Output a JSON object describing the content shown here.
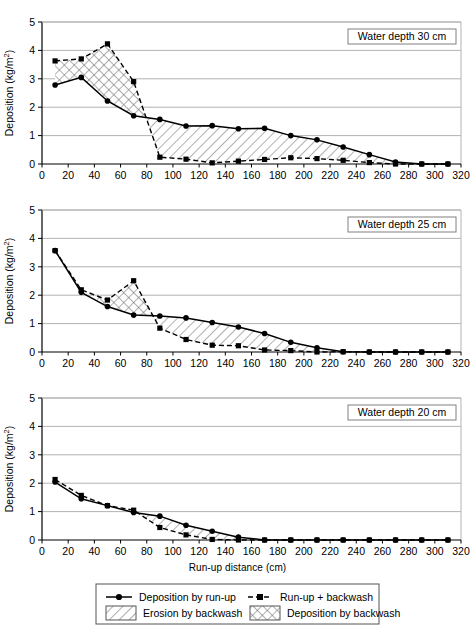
{
  "figure": {
    "xlabel": "Run-up distance (cm)",
    "ylabel": "Deposition (kg/m2)",
    "ylabel_base": "Deposition (kg/m",
    "ylabel_sup": "2",
    "ylabel_close": ")",
    "x_ticks": [
      0,
      20,
      40,
      60,
      80,
      100,
      120,
      140,
      160,
      180,
      200,
      220,
      240,
      260,
      280,
      300,
      320
    ],
    "y_ticks": [
      0,
      1,
      2,
      3,
      4,
      5
    ],
    "xlim": [
      0,
      320
    ],
    "ylim": [
      0,
      5
    ],
    "grid": "horizontal",
    "colors": {
      "axis": "#000000",
      "gridline": "#b3b3b3",
      "series_runup": "#000000",
      "series_backwash": "#000000",
      "hatch": "#6e6e6e",
      "panel_border": "#808080",
      "label_box_border": "#808080"
    }
  },
  "legend": {
    "position": "bottom",
    "entries": [
      {
        "key": "deposition-by-run-up",
        "label": "Deposition by run-up",
        "marker": "solid-line-circle"
      },
      {
        "key": "run-up-plus-backwash",
        "label": "Run-up + backwash",
        "marker": "dashed-line-square"
      },
      {
        "key": "erosion-by-backwash",
        "label": "Erosion by backwash",
        "marker": "diagonal-hatch-swatch"
      },
      {
        "key": "deposition-by-backwash",
        "label": "Deposition by backwash",
        "marker": "cross-hatch-swatch"
      }
    ]
  },
  "chart_data": [
    {
      "type": "line",
      "id": "panel-30cm",
      "title": "Water depth 30 cm",
      "xlabel": "Run-up distance (cm)",
      "ylabel": "Deposition (kg/m2)",
      "xlim": [
        0,
        320
      ],
      "ylim": [
        0,
        5
      ],
      "x": [
        10,
        30,
        50,
        70,
        90,
        110,
        130,
        150,
        170,
        190,
        210,
        230,
        250,
        270,
        290,
        310
      ],
      "series": [
        {
          "name": "Deposition by run-up",
          "values": [
            2.78,
            3.05,
            2.22,
            1.7,
            1.57,
            1.34,
            1.35,
            1.24,
            1.26,
            1.0,
            0.85,
            0.6,
            0.33,
            0.07,
            0.0,
            0.0
          ]
        },
        {
          "name": "Run-up + backwash",
          "values": [
            3.63,
            3.7,
            4.23,
            2.9,
            0.24,
            0.17,
            0.04,
            0.1,
            0.16,
            0.22,
            0.19,
            0.13,
            0.05,
            0.0,
            0.0,
            0.0
          ]
        }
      ],
      "regions": [
        {
          "kind": "deposition-by-backwash",
          "x_from": 10,
          "x_to": 80
        },
        {
          "kind": "erosion-by-backwash",
          "x_from": 80,
          "x_to": 275
        }
      ]
    },
    {
      "type": "line",
      "id": "panel-25cm",
      "title": "Water depth 25 cm",
      "xlabel": "Run-up distance (cm)",
      "ylabel": "Deposition (kg/m2)",
      "xlim": [
        0,
        320
      ],
      "ylim": [
        0,
        5
      ],
      "x": [
        10,
        30,
        50,
        70,
        90,
        110,
        130,
        150,
        170,
        190,
        210,
        230,
        250,
        270,
        290,
        310
      ],
      "series": [
        {
          "name": "Deposition by run-up",
          "values": [
            3.57,
            2.1,
            1.6,
            1.3,
            1.27,
            1.2,
            1.04,
            0.88,
            0.65,
            0.34,
            0.15,
            0.01,
            0.0,
            0.0,
            0.0,
            0.0
          ]
        },
        {
          "name": "Run-up + backwash",
          "values": [
            3.57,
            2.19,
            1.83,
            2.51,
            0.84,
            0.44,
            0.24,
            0.22,
            0.07,
            0.05,
            0.0,
            0.01,
            0.0,
            0.0,
            0.0,
            0.0
          ]
        }
      ],
      "regions": [
        {
          "kind": "deposition-by-backwash",
          "x_from": 42,
          "x_to": 85
        },
        {
          "kind": "erosion-by-backwash",
          "x_from": 85,
          "x_to": 215
        }
      ]
    },
    {
      "type": "line",
      "id": "panel-20cm",
      "title": "Water depth 20 cm",
      "xlabel": "Run-up distance (cm)",
      "ylabel": "Deposition (kg/m2)",
      "xlim": [
        0,
        320
      ],
      "ylim": [
        0,
        5
      ],
      "x": [
        10,
        30,
        50,
        70,
        90,
        110,
        130,
        150,
        170,
        190,
        210,
        230,
        250,
        270,
        290,
        310
      ],
      "series": [
        {
          "name": "Deposition by run-up",
          "values": [
            2.04,
            1.45,
            1.21,
            0.97,
            0.84,
            0.52,
            0.31,
            0.1,
            0.0,
            0.0,
            0.0,
            0.0,
            0.0,
            0.0,
            0.0,
            0.0
          ]
        },
        {
          "name": "Run-up + backwash",
          "values": [
            2.13,
            1.57,
            1.21,
            1.05,
            0.44,
            0.18,
            0.02,
            0.0,
            0.0,
            0.0,
            0.0,
            0.0,
            0.0,
            0.0,
            0.0,
            0.0
          ]
        }
      ],
      "regions": [
        {
          "kind": "erosion-by-backwash",
          "x_from": 70,
          "x_to": 150
        }
      ]
    }
  ]
}
